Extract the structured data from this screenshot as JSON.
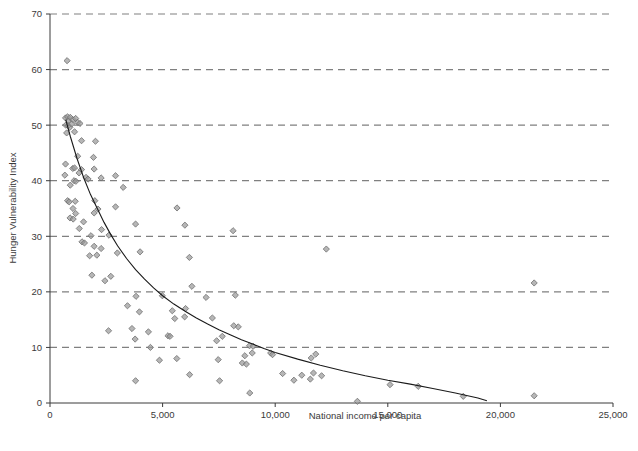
{
  "chart_data": {
    "type": "scatter",
    "title": "",
    "xlabel": "National income per capita",
    "ylabel": "Hunger Vulnerability Index",
    "xlim": [
      0,
      25000
    ],
    "ylim": [
      0,
      70
    ],
    "xticks": [
      0,
      5000,
      10000,
      15000,
      20000,
      25000
    ],
    "xtick_labels": [
      "0",
      "5,000",
      "10,000",
      "15,000",
      "20,000",
      "25,000"
    ],
    "yticks": [
      0,
      10,
      20,
      30,
      40,
      50,
      60,
      70
    ],
    "ytick_labels": [
      "0",
      "10",
      "20",
      "30",
      "40",
      "50",
      "60",
      "70"
    ],
    "grid": "horizontal-dashed",
    "grid_color": "#808080",
    "legend": null,
    "marker": "diamond",
    "marker_color": "#9a9a9a",
    "marker_edge_color": "#6e6e6e",
    "trendline": {
      "label": "fitted decay curve",
      "color": "#1a1a1a",
      "style": "solid",
      "points": [
        [
          700,
          51.0
        ],
        [
          900,
          48.0
        ],
        [
          1200,
          44.0
        ],
        [
          1500,
          40.5
        ],
        [
          1800,
          37.5
        ],
        [
          2100,
          35.0
        ],
        [
          2400,
          32.5
        ],
        [
          2700,
          30.3
        ],
        [
          3000,
          28.3
        ],
        [
          3400,
          26.0
        ],
        [
          3800,
          24.0
        ],
        [
          4200,
          22.3
        ],
        [
          4600,
          20.7
        ],
        [
          5000,
          19.3
        ],
        [
          5500,
          17.8
        ],
        [
          6000,
          16.5
        ],
        [
          6500,
          15.3
        ],
        [
          7000,
          14.2
        ],
        [
          7500,
          13.2
        ],
        [
          8000,
          12.3
        ],
        [
          8500,
          11.4
        ],
        [
          9000,
          10.6
        ],
        [
          9500,
          9.8
        ],
        [
          10000,
          9.1
        ],
        [
          11000,
          7.9
        ],
        [
          12000,
          6.8
        ],
        [
          13000,
          5.8
        ],
        [
          14000,
          4.9
        ],
        [
          15000,
          4.1
        ],
        [
          16000,
          3.4
        ],
        [
          17000,
          2.6
        ],
        [
          18000,
          1.8
        ],
        [
          19000,
          0.9
        ],
        [
          19400,
          0.4
        ]
      ]
    },
    "points": [
      [
        760,
        61.6
      ],
      [
        690,
        51.3
      ],
      [
        780,
        51.5
      ],
      [
        830,
        50.8
      ],
      [
        900,
        51.4
      ],
      [
        1020,
        51.0
      ],
      [
        1140,
        51.2
      ],
      [
        1230,
        50.5
      ],
      [
        1330,
        50.3
      ],
      [
        700,
        50.0
      ],
      [
        810,
        49.9
      ],
      [
        880,
        49.6
      ],
      [
        960,
        50.2
      ],
      [
        740,
        48.6
      ],
      [
        1090,
        48.8
      ],
      [
        1400,
        47.2
      ],
      [
        2020,
        47.1
      ],
      [
        1230,
        44.4
      ],
      [
        1930,
        44.2
      ],
      [
        690,
        43.0
      ],
      [
        1010,
        42.2
      ],
      [
        1090,
        42.3
      ],
      [
        1400,
        42.0
      ],
      [
        1960,
        42.1
      ],
      [
        660,
        41.0
      ],
      [
        1290,
        41.4
      ],
      [
        1600,
        40.6
      ],
      [
        1690,
        40.3
      ],
      [
        2270,
        40.5
      ],
      [
        2910,
        40.9
      ],
      [
        1070,
        40.0
      ],
      [
        1150,
        39.9
      ],
      [
        900,
        39.2
      ],
      [
        3250,
        38.8
      ],
      [
        780,
        36.4
      ],
      [
        850,
        36.2
      ],
      [
        1120,
        36.3
      ],
      [
        1990,
        36.4
      ],
      [
        1020,
        35.0
      ],
      [
        2130,
        34.9
      ],
      [
        2910,
        35.3
      ],
      [
        5640,
        35.1
      ],
      [
        1140,
        34.1
      ],
      [
        1960,
        34.2
      ],
      [
        890,
        33.3
      ],
      [
        1030,
        33.1
      ],
      [
        1490,
        32.6
      ],
      [
        3800,
        32.2
      ],
      [
        5990,
        32.0
      ],
      [
        1300,
        31.4
      ],
      [
        2290,
        31.2
      ],
      [
        8130,
        31.0
      ],
      [
        1820,
        30.1
      ],
      [
        2620,
        30.2
      ],
      [
        1420,
        29.0
      ],
      [
        1530,
        28.8
      ],
      [
        1960,
        28.2
      ],
      [
        2270,
        27.8
      ],
      [
        1760,
        26.5
      ],
      [
        2080,
        26.6
      ],
      [
        2990,
        27.0
      ],
      [
        4000,
        27.2
      ],
      [
        6190,
        26.2
      ],
      [
        12270,
        27.7
      ],
      [
        1860,
        23.0
      ],
      [
        2440,
        22.0
      ],
      [
        2700,
        22.8
      ],
      [
        6300,
        21.0
      ],
      [
        21500,
        21.6
      ],
      [
        3820,
        19.2
      ],
      [
        4990,
        19.3
      ],
      [
        6930,
        19.0
      ],
      [
        8230,
        19.4
      ],
      [
        3440,
        17.5
      ],
      [
        3970,
        16.4
      ],
      [
        5430,
        16.6
      ],
      [
        6020,
        17.0
      ],
      [
        5540,
        15.2
      ],
      [
        5980,
        15.5
      ],
      [
        7210,
        15.3
      ],
      [
        2600,
        13.0
      ],
      [
        3640,
        13.4
      ],
      [
        4370,
        12.8
      ],
      [
        5240,
        12.1
      ],
      [
        5330,
        12.0
      ],
      [
        7650,
        12.0
      ],
      [
        8360,
        13.7
      ],
      [
        8160,
        13.9
      ],
      [
        3780,
        11.5
      ],
      [
        7400,
        11.2
      ],
      [
        4460,
        10.0
      ],
      [
        8860,
        10.3
      ],
      [
        9020,
        10.2
      ],
      [
        9800,
        9.0
      ],
      [
        9880,
        8.7
      ],
      [
        11800,
        8.8
      ],
      [
        4860,
        7.7
      ],
      [
        5630,
        8.0
      ],
      [
        7470,
        7.8
      ],
      [
        8650,
        8.5
      ],
      [
        8980,
        9.0
      ],
      [
        11600,
        8.1
      ],
      [
        8540,
        7.2
      ],
      [
        8720,
        7.0
      ],
      [
        6200,
        5.1
      ],
      [
        10330,
        5.3
      ],
      [
        11180,
        5.0
      ],
      [
        11700,
        5.4
      ],
      [
        12060,
        4.9
      ],
      [
        7530,
        4.0
      ],
      [
        3800,
        4.0
      ],
      [
        10830,
        4.1
      ],
      [
        11560,
        4.3
      ],
      [
        8870,
        1.8
      ],
      [
        13650,
        0.3
      ],
      [
        18350,
        1.2
      ],
      [
        21500,
        1.3
      ],
      [
        16350,
        3.0
      ],
      [
        15100,
        3.3
      ]
    ]
  },
  "top_partial_text": "",
  "caption_partial_text": ""
}
